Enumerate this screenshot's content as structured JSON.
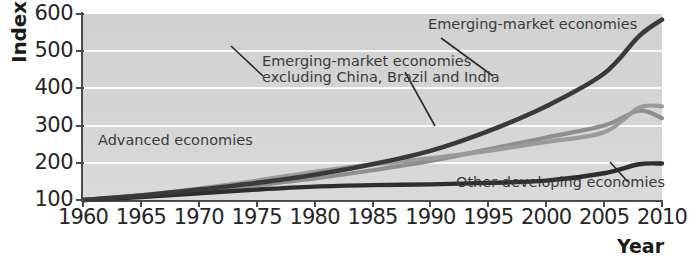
{
  "chart_data": {
    "type": "line",
    "title": "",
    "xlabel": "Year",
    "ylabel": "Index",
    "xlim": [
      1960,
      2010
    ],
    "ylim": [
      100,
      600
    ],
    "grid": true,
    "legend_position": "inline-annotations",
    "x_ticks": [
      "1960",
      "1965",
      "1970",
      "1975",
      "1980",
      "1985",
      "1990",
      "1995",
      "2000",
      "2005",
      "2010"
    ],
    "y_ticks": [
      "100",
      "200",
      "300",
      "400",
      "500",
      "600"
    ],
    "x": [
      1960,
      1965,
      1970,
      1975,
      1980,
      1985,
      1990,
      1995,
      2000,
      2005,
      2008,
      2010
    ],
    "series": [
      {
        "name": "Emerging-market economies",
        "color": "#3a3a3a",
        "width": 4.6,
        "values": [
          100,
          112,
          128,
          146,
          168,
          196,
          232,
          285,
          352,
          440,
          540,
          585
        ]
      },
      {
        "name": "Emerging-market economies excluding China, Brazil and India",
        "color": "#8e8e8e",
        "width": 4.2,
        "values": [
          100,
          110,
          124,
          140,
          158,
          180,
          205,
          236,
          268,
          300,
          340,
          320
        ]
      },
      {
        "name": "Advanced economies",
        "color": "#9a9a9a",
        "width": 4.2,
        "values": [
          100,
          113,
          131,
          152,
          176,
          196,
          212,
          232,
          256,
          282,
          348,
          352
        ]
      },
      {
        "name": "Other developing economies",
        "color": "#2e2e2e",
        "width": 4.4,
        "values": [
          100,
          108,
          118,
          128,
          136,
          140,
          142,
          146,
          152,
          172,
          196,
          198
        ]
      }
    ],
    "annotations": [
      {
        "name": "emerging-market-economies",
        "text": "Emerging-market economies"
      },
      {
        "name": "emerging-excluding-line1",
        "text": "Emerging-market economies"
      },
      {
        "name": "emerging-excluding-line2",
        "text": "excluding China, Brazil and India"
      },
      {
        "name": "advanced-economies",
        "text": "Advanced economies"
      },
      {
        "name": "other-developing-economies",
        "text": "Other developing economies"
      }
    ]
  },
  "axes": {
    "y_title": "Index",
    "x_title": "Year"
  },
  "colors": {
    "plot_background": "#d7d7d7",
    "gridline": "#fafafa",
    "axis": "#4a4a4a",
    "emerging": "#3a3a3a",
    "emerging_excl": "#8e8e8e",
    "advanced": "#9a9a9a",
    "other_developing": "#2e2e2e"
  }
}
